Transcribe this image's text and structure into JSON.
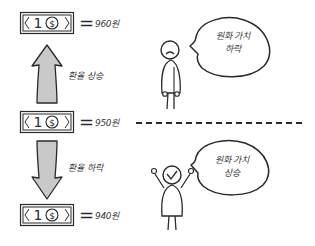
{
  "diagram": {
    "title": "",
    "bills": [
      {
        "id": "top",
        "denomination": "1",
        "symbol": "$",
        "equals": "=",
        "rate": "960원"
      },
      {
        "id": "middle",
        "denomination": "1",
        "symbol": "$",
        "equals": "=",
        "rate": "950원"
      },
      {
        "id": "bottom",
        "denomination": "1",
        "symbol": "$",
        "equals": "=",
        "rate": "940원"
      }
    ],
    "arrows": [
      {
        "direction": "up",
        "label": "환율 상승"
      },
      {
        "direction": "down",
        "label": "환율 하락"
      }
    ],
    "characters": [
      {
        "mood": "sad",
        "speech_line1": "원화 가치",
        "speech_line2": "하락"
      },
      {
        "mood": "happy",
        "speech_line1": "원화 가치",
        "speech_line2": "상승"
      }
    ],
    "colors": {
      "line": "#2a2a2a",
      "arrow_fill": "#c9c9c9",
      "background": "#ffffff"
    }
  }
}
